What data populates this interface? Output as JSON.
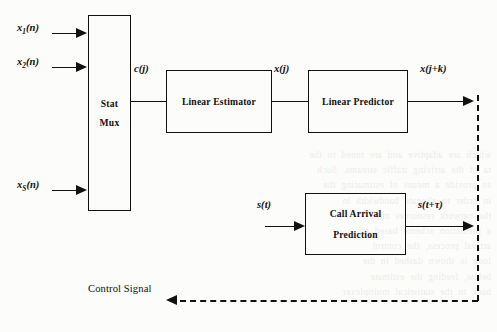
{
  "figure": {
    "type": "block-diagram"
  },
  "blocks": {
    "stat_mux": {
      "line1": "Stat",
      "line2": "Mux"
    },
    "linear_estimator": {
      "label": "Linear Estimator"
    },
    "linear_predictor": {
      "label": "Linear Predictor"
    },
    "call_arrival": {
      "line1": "Call Arrival",
      "line2": "Prediction"
    }
  },
  "inputs": [
    {
      "var": "x",
      "sub": "1",
      "suffix": "(n)"
    },
    {
      "var": "x",
      "sub": "2",
      "suffix": "(n)"
    },
    {
      "var": "x",
      "sub": "S",
      "suffix": "(n)"
    }
  ],
  "signals": {
    "mux_out": "c(j)",
    "estimator_out": "x(j)",
    "predictor_out": "x(j+k)",
    "call_in": "s(t)",
    "call_out": "s(t+τ)"
  },
  "feedback": {
    "label": "Control Signal",
    "style": "dashed"
  },
  "colors": {
    "line": "#111111",
    "background": "#fcfcfa"
  },
  "background_text": [
    "which are adaptive and are tuned to the",
    "ta of the arriving traffic streams. Such",
    "so provide a means of estimating the",
    "in order to allocate bandwidth in",
    "the network resources more",
    "a prediction scheme based on",
    "arrival process, the control",
    "loop is shown dashed in the",
    "below, feeding the estimate",
    "back to the statistical multiplexer"
  ]
}
